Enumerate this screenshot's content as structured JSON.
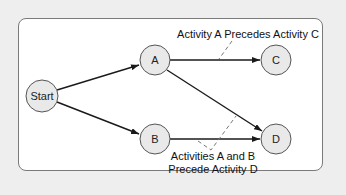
{
  "diagram": {
    "type": "precedence-network",
    "colors": {
      "background": "#eeeeee",
      "panel": "#ffffff",
      "panel_border": "#7a7a7a",
      "node_fill": "#e9e9e9",
      "node_stroke": "#555555",
      "edge": "#1a1a1a",
      "dash": "#777777"
    },
    "nodes": [
      {
        "id": "start",
        "label": "Start",
        "cx": 42,
        "cy": 96,
        "r": 16
      },
      {
        "id": "a",
        "label": "A",
        "cx": 155,
        "cy": 60,
        "r": 15
      },
      {
        "id": "b",
        "label": "B",
        "cx": 155,
        "cy": 139,
        "r": 15
      },
      {
        "id": "c",
        "label": "C",
        "cx": 276,
        "cy": 60,
        "r": 15
      },
      {
        "id": "d",
        "label": "D",
        "cx": 276,
        "cy": 139,
        "r": 15
      }
    ],
    "edges": [
      {
        "from": "start",
        "to": "a"
      },
      {
        "from": "start",
        "to": "b"
      },
      {
        "from": "a",
        "to": "c"
      },
      {
        "from": "a",
        "to": "d"
      },
      {
        "from": "b",
        "to": "d"
      }
    ],
    "annotations": [
      {
        "id": "a-precedes-c",
        "lines": [
          "Activity A Precedes Activity C"
        ]
      },
      {
        "id": "ab-precede-d",
        "lines": [
          "Activities A and B",
          "Precede Activity D"
        ]
      }
    ]
  }
}
